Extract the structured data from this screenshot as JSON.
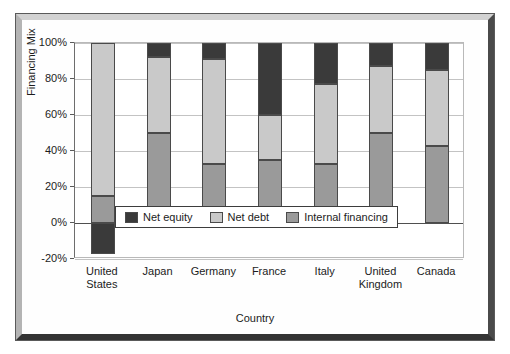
{
  "chart_data": {
    "type": "bar",
    "subtype": "stacked-column",
    "title": "",
    "xlabel": "Country",
    "ylabel": "Financing Mix",
    "categories": [
      "United States",
      "Japan",
      "Germany",
      "France",
      "Italy",
      "United Kingdom",
      "Canada"
    ],
    "category_lines": [
      [
        "United",
        "States"
      ],
      [
        "Japan",
        ""
      ],
      [
        "Germany",
        ""
      ],
      [
        "France",
        ""
      ],
      [
        "Italy",
        ""
      ],
      [
        "United",
        "Kingdom"
      ],
      [
        "Canada",
        ""
      ]
    ],
    "series": [
      {
        "name": "Internal financing",
        "color": "#9a9a9a",
        "values": [
          15,
          50,
          33,
          35,
          33,
          50,
          43
        ]
      },
      {
        "name": "Net debt",
        "color": "#c9c9c9",
        "values": [
          85,
          42,
          58,
          25,
          44,
          37,
          42
        ]
      },
      {
        "name": "Net equity",
        "color": "#3a3a3a",
        "values": [
          -17,
          8,
          9,
          40,
          23,
          13,
          15
        ]
      }
    ],
    "ylim": [
      -20,
      100
    ],
    "yticks": [
      -20,
      0,
      20,
      40,
      60,
      80,
      100
    ],
    "ytick_labels": [
      "-20%",
      "0%",
      "20%",
      "40%",
      "60%",
      "80%",
      "100%"
    ],
    "grid": true,
    "legend_position": "inside-center-lower",
    "legend_entries": [
      {
        "label": "Net equity",
        "color": "#3a3a3a"
      },
      {
        "label": "Net debt",
        "color": "#c9c9c9"
      },
      {
        "label": "Internal financing",
        "color": "#9a9a9a"
      }
    ]
  },
  "figure": {
    "top_artifact_text": ""
  }
}
